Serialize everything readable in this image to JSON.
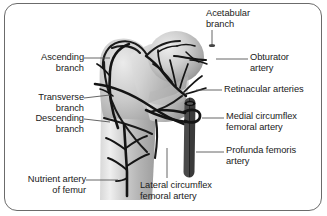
{
  "figure": {
    "frame_color": "#6b6b6b",
    "background_color": "#ffffff",
    "artery_color": "#1a1a1a",
    "bone_fill_light": "#e2e2e2",
    "bone_fill_mid": "#c6c6c6",
    "bone_fill_dark": "#9a9a9a",
    "vessel_dark": "#262626",
    "leader_color": "#555555"
  },
  "labels": {
    "ascending_branch": "Ascending\nbranch",
    "transverse_branch": "Transverse\nbranch",
    "descending_branch": "Descending\nbranch",
    "nutrient_artery": "Nutrient artery\nof femur",
    "acetabular_branch": "Acetabular\nbranch",
    "obturator_artery": "Obturator\nartery",
    "retinacular_arteries": "Retinacular arteries",
    "medial_circumflex": "Medial circumflex\nfemoral artery",
    "profunda_femoris": "Profunda femoris\nartery",
    "lateral_circumflex": "Lateral circumflex\nfemoral artery"
  },
  "structures": [
    {
      "name": "femur-bone",
      "kind": "bone"
    },
    {
      "name": "femoral-head",
      "kind": "bone"
    },
    {
      "name": "greater-trochanter",
      "kind": "bone"
    },
    {
      "name": "femoral-shaft",
      "kind": "bone"
    },
    {
      "name": "ascending-branch-artery",
      "kind": "artery"
    },
    {
      "name": "transverse-branch-artery",
      "kind": "artery"
    },
    {
      "name": "descending-branch-artery",
      "kind": "artery"
    },
    {
      "name": "nutrient-artery-vessel",
      "kind": "artery"
    },
    {
      "name": "retinacular-arteries-vessel",
      "kind": "artery"
    },
    {
      "name": "acetabular-branch-vessel",
      "kind": "artery"
    },
    {
      "name": "obturator-artery-vessel",
      "kind": "vessel"
    },
    {
      "name": "profunda-femoris-vessel",
      "kind": "vessel"
    },
    {
      "name": "medial-circumflex-ring",
      "kind": "vessel"
    }
  ]
}
